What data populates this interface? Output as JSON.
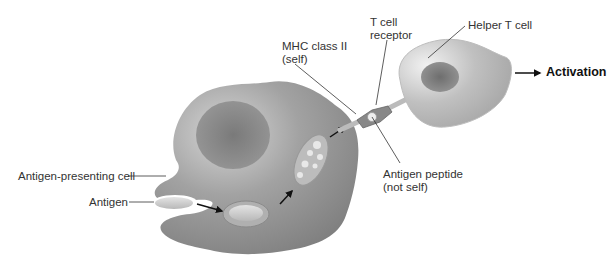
{
  "diagram": {
    "labels": {
      "mhc": [
        "MHC class II",
        "(self)"
      ],
      "tcr": [
        "T cell",
        "receptor"
      ],
      "helper": "Helper T cell",
      "activation": "Activation",
      "apc": "Antigen-presenting cell",
      "antigen": "Antigen",
      "peptide": [
        "Antigen peptide",
        "(not self)"
      ]
    },
    "colors": {
      "cell_fill": "#9a9a9a",
      "cell_highlight": "#d8d8d8",
      "nucleus": "#707070",
      "tcell_fill": "#c4c4c4",
      "leader_line": "#333333",
      "arrow": "#111111"
    }
  }
}
